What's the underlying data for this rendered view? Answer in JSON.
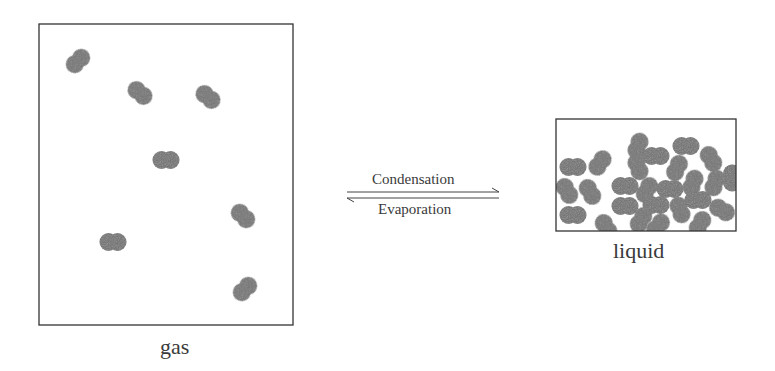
{
  "diagram": {
    "type": "phase-change",
    "gas": {
      "label": "gas",
      "box": {
        "x": 39,
        "y": 24,
        "w": 254,
        "h": 301
      },
      "molecules": [
        {
          "x": 78,
          "y": 61,
          "angle": -45
        },
        {
          "x": 140,
          "y": 93,
          "angle": 40
        },
        {
          "x": 208,
          "y": 97,
          "angle": 40
        },
        {
          "x": 166,
          "y": 160,
          "angle": 0
        },
        {
          "x": 243,
          "y": 216,
          "angle": 45
        },
        {
          "x": 113,
          "y": 242,
          "angle": 0
        },
        {
          "x": 245,
          "y": 289,
          "angle": -45
        }
      ]
    },
    "liquid": {
      "label": "liquid",
      "box": {
        "x": 556,
        "y": 119,
        "w": 180,
        "h": 112
      },
      "molecules": [
        {
          "x": 573,
          "y": 167,
          "angle": 0
        },
        {
          "x": 600,
          "y": 163,
          "angle": -55
        },
        {
          "x": 567,
          "y": 191,
          "angle": 60
        },
        {
          "x": 590,
          "y": 192,
          "angle": 60
        },
        {
          "x": 573,
          "y": 215,
          "angle": 0
        },
        {
          "x": 638,
          "y": 146,
          "angle": -70
        },
        {
          "x": 656,
          "y": 156,
          "angle": 0
        },
        {
          "x": 686,
          "y": 146,
          "angle": 0
        },
        {
          "x": 711,
          "y": 159,
          "angle": 60
        },
        {
          "x": 638,
          "y": 167,
          "angle": 70
        },
        {
          "x": 677,
          "y": 168,
          "angle": -65
        },
        {
          "x": 625,
          "y": 186,
          "angle": 0
        },
        {
          "x": 647,
          "y": 190,
          "angle": -60
        },
        {
          "x": 670,
          "y": 189,
          "angle": 0
        },
        {
          "x": 693,
          "y": 183,
          "angle": -70
        },
        {
          "x": 715,
          "y": 183,
          "angle": -70
        },
        {
          "x": 732,
          "y": 178,
          "angle": 90
        },
        {
          "x": 625,
          "y": 206,
          "angle": 0
        },
        {
          "x": 656,
          "y": 205,
          "angle": 0
        },
        {
          "x": 680,
          "y": 210,
          "angle": 70
        },
        {
          "x": 698,
          "y": 200,
          "angle": 0
        },
        {
          "x": 722,
          "y": 210,
          "angle": 30
        },
        {
          "x": 641,
          "y": 220,
          "angle": -60
        },
        {
          "x": 606,
          "y": 227,
          "angle": 60
        },
        {
          "x": 658,
          "y": 226,
          "angle": -50
        },
        {
          "x": 700,
          "y": 224,
          "angle": -60
        }
      ]
    },
    "arrows": {
      "forward_label": "Condensation",
      "reverse_label": "Evaporation",
      "x1": 347,
      "x2": 499,
      "forward_y": 192,
      "reverse_y": 198
    },
    "colors": {
      "molecule": "#6e6e6e",
      "border": "#333333",
      "text": "#3a3a3a"
    }
  }
}
